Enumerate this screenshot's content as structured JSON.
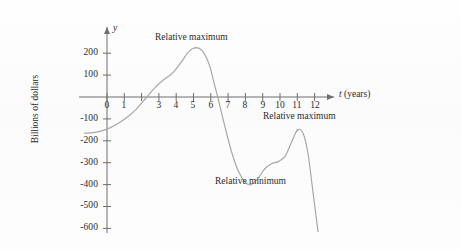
{
  "figure": {
    "background_color": "#fdfdfd",
    "curve_color": "#a8a8a8",
    "axis_color": "#6e6e6e",
    "text_color": "#2b2b2b"
  },
  "axes": {
    "x_axis_label_italic": "t",
    "x_axis_label_rest": " (years)",
    "y_axis_label_italic": "y",
    "y_axis_title": "Billions of dollars",
    "origin_label": "0"
  },
  "annotations": [
    {
      "name": "relative-maximum-1",
      "text": "Relative maximum"
    },
    {
      "name": "relative-maximum-2",
      "text": "Relative maximum"
    },
    {
      "name": "relative-minimum-1",
      "text": "Relative minimum"
    }
  ],
  "chart_data": {
    "type": "line",
    "title": "",
    "subtitle": "",
    "xlabel": "t (years)",
    "ylabel": "Billions of dollars",
    "xlim": [
      -1.3,
      12.6
    ],
    "ylim": [
      -640,
      260
    ],
    "grid": false,
    "legend": null,
    "x_ticks": [
      0,
      1,
      2,
      3,
      4,
      5,
      6,
      7,
      8,
      9,
      10,
      11,
      12
    ],
    "x_tick_labels": [
      "0",
      "1",
      "",
      "3",
      "4",
      "5",
      "6",
      "7",
      "8",
      "9",
      "10",
      "11",
      "12"
    ],
    "y_ticks": [
      200,
      100,
      0,
      -100,
      -200,
      -300,
      -400,
      -500,
      -600
    ],
    "y_tick_labels": [
      "200",
      "100",
      "",
      "-100",
      "-200",
      "-300",
      "-400",
      "-500",
      "-600"
    ],
    "series": [
      {
        "name": "budget-curve",
        "color": "#a8a8a8",
        "x": [
          -1.3,
          -0.8,
          -0.3,
          0.2,
          0.7,
          1.2,
          1.7,
          2.3,
          2.8,
          3.3,
          3.8,
          4.3,
          4.7,
          5.1,
          5.5,
          5.9,
          6.2,
          6.4,
          6.8,
          7.2,
          7.6,
          8.0,
          8.3,
          8.7,
          9.1,
          9.5,
          9.9,
          10.3,
          10.7,
          11.0,
          11.3,
          11.6,
          11.9,
          12.2
        ],
        "y": [
          -165,
          -163,
          -155,
          -140,
          -118,
          -90,
          -55,
          0,
          45,
          80,
          110,
          160,
          205,
          225,
          212,
          150,
          60,
          0,
          -130,
          -250,
          -340,
          -390,
          -400,
          -375,
          -330,
          -305,
          -295,
          -270,
          -200,
          -152,
          -160,
          -250,
          -430,
          -615
        ]
      }
    ],
    "extrema": [
      {
        "label": "Relative maximum",
        "t": 5.1,
        "value": 225
      },
      {
        "label": "Relative minimum",
        "t": 8.3,
        "value": -400
      },
      {
        "label": "Relative maximum",
        "t": 11.0,
        "value": -152
      }
    ]
  }
}
